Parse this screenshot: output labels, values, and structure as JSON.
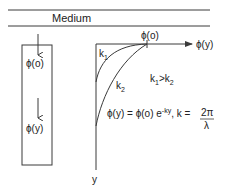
{
  "diagram": {
    "title": "Medium",
    "colors": {
      "stroke": "#3a3a3a",
      "text": "#222222",
      "background": "#ffffff"
    },
    "left_panel": {
      "top_label": "ϕ(o)",
      "bottom_label": "ϕ(y)"
    },
    "graph": {
      "x_axis_label": "ϕ(y)",
      "y_axis_label": "y",
      "tick_label": "ϕ(o)",
      "curves": [
        {
          "name": "k",
          "subscript": "1"
        },
        {
          "name": "k",
          "subscript": "2"
        }
      ],
      "relation": {
        "a": "k",
        "a_sub": "1",
        "op": ">",
        "b": "k",
        "b_sub": "2"
      },
      "equation": {
        "lhs": "ϕ(y) = ϕ(o) e",
        "exponent": "-ky",
        "mid": ", k = ",
        "numerator": "2π",
        "denominator": "λ"
      }
    }
  }
}
